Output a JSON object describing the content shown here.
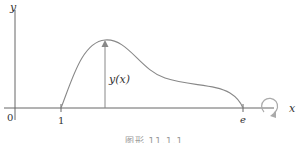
{
  "figure": {
    "type": "solid-of-revolution sketch",
    "axes": {
      "x_label": "x",
      "y_label": "y",
      "origin_label": "0"
    },
    "ticks": [
      {
        "label": "1",
        "x": 1
      },
      {
        "label": "e",
        "x": "e"
      }
    ],
    "curve_label": "y(x)",
    "rotation_indicator": "rotation about x-axis",
    "caption": "图形 11.1.1"
  },
  "colors": {
    "axis": "#555555",
    "curve": "#888888",
    "text": "#333333",
    "rotation": "#aaaaaa"
  }
}
